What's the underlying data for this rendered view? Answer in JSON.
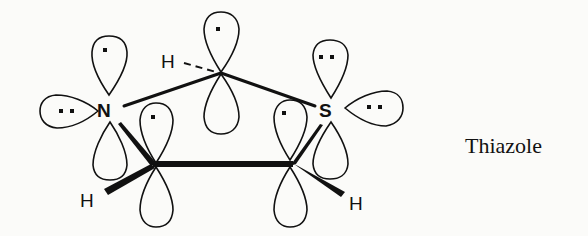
{
  "figure": {
    "caption": "Thiazole",
    "atoms": {
      "nitrogen": "N",
      "sulfur": "S",
      "h_top": "H",
      "h_left": "H",
      "h_right": "H"
    },
    "orbitals": {
      "n_p_orbital_electrons": 1,
      "n_lone_pair_electrons": 2,
      "c2_p_orbital_electrons": 1,
      "c4_p_orbital_electrons": 1,
      "c5_p_orbital_electrons": 1,
      "s_p_orbital_electrons": 2,
      "s_lone_pair_electrons": 2
    },
    "colors": {
      "ink": "#111111",
      "background": "#fbfbf9"
    }
  }
}
